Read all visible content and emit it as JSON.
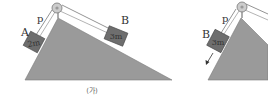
{
  "figure_left": {
    "caption": "(가)",
    "string_label": "p",
    "block_a": {
      "label": "A",
      "mass": "2m"
    },
    "block_b": {
      "label": "B",
      "mass": "3m"
    }
  },
  "figure_right": {
    "string_label": "p",
    "block_b": {
      "label": "B",
      "mass": "3m"
    },
    "motion_arrow": "down-slope"
  },
  "colors": {
    "incline_fill": "#9a9a9a",
    "block_fill": "#6e6e6e",
    "line": "#555555",
    "pulley": "#c8c8c8"
  }
}
